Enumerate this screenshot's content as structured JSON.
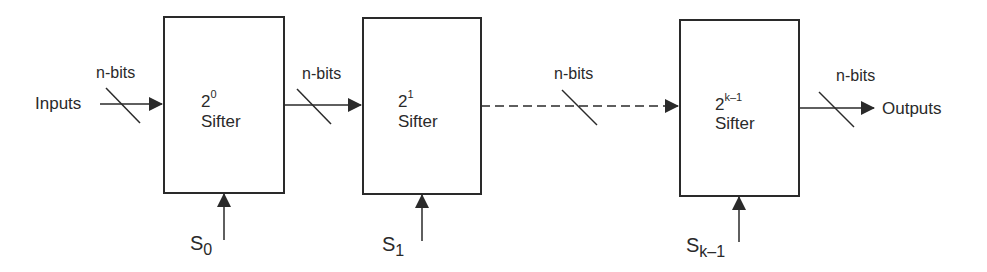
{
  "diagram": {
    "type": "block-diagram",
    "input_label": "Inputs",
    "output_label": "Outputs",
    "bus_label": "n-bits",
    "stages": [
      {
        "base": "2",
        "exponent": "0",
        "name": "Sifter",
        "select_main": "S",
        "select_sub": "0"
      },
      {
        "base": "2",
        "exponent": "1",
        "name": "Sifter",
        "select_main": "S",
        "select_sub": "1"
      },
      {
        "base": "2",
        "exponent": "k–1",
        "name": "Sifter",
        "select_main": "S",
        "select_sub": "k–1"
      }
    ],
    "connections": [
      {
        "from": "Inputs",
        "to": "stage-0",
        "label": "n-bits",
        "style": "solid"
      },
      {
        "from": "stage-0",
        "to": "stage-1",
        "label": "n-bits",
        "style": "solid"
      },
      {
        "from": "stage-1",
        "to": "stage-2",
        "label": "n-bits",
        "style": "dashed"
      },
      {
        "from": "stage-2",
        "to": "Outputs",
        "label": "n-bits",
        "style": "solid"
      }
    ],
    "colors": {
      "stroke": "#2a2a2a",
      "background": "#ffffff"
    }
  }
}
